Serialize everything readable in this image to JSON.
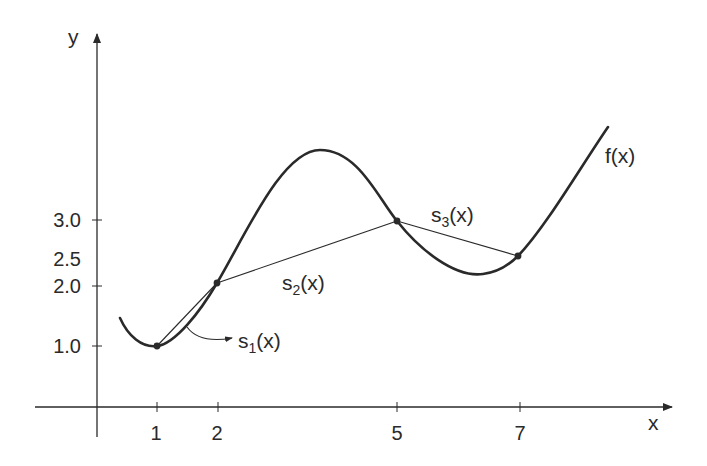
{
  "diagram": {
    "type": "linear-spline-interpolation",
    "axes": {
      "x_label": "x",
      "y_label": "y",
      "x_ticks": [
        {
          "value": 1,
          "label": "1"
        },
        {
          "value": 2,
          "label": "2"
        },
        {
          "value": 5,
          "label": "5"
        },
        {
          "value": 7,
          "label": "7"
        }
      ],
      "y_ticks": [
        {
          "value": 1.0,
          "label": "1.0"
        },
        {
          "value": 2.0,
          "label": "2.0"
        },
        {
          "value": 2.5,
          "label": "2.5"
        },
        {
          "value": 3.0,
          "label": "3.0"
        }
      ]
    },
    "curve": {
      "label": "f(x)"
    },
    "knots": [
      {
        "x": 1,
        "y": 1.0
      },
      {
        "x": 2,
        "y": 2.0
      },
      {
        "x": 5,
        "y": 3.0
      },
      {
        "x": 7,
        "y": 2.5
      }
    ],
    "segments": [
      {
        "name": "s",
        "sub": "1",
        "tail": "(x)",
        "from_x": 1,
        "to_x": 2
      },
      {
        "name": "s",
        "sub": "2",
        "tail": "(x)",
        "from_x": 2,
        "to_x": 5
      },
      {
        "name": "s",
        "sub": "3",
        "tail": "(x)",
        "from_x": 5,
        "to_x": 7
      }
    ],
    "colors": {
      "ink": "#2a2a2a",
      "background": "#ffffff"
    }
  }
}
